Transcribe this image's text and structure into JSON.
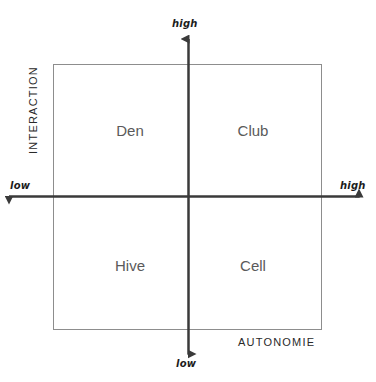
{
  "diagram": {
    "type": "2x2-matrix",
    "background_color": "#ffffff",
    "box_border_color": "#8d8d8d",
    "axis_color": "#3a3a3a",
    "quadrant_label_color": "#5a5a5a",
    "axes": {
      "vertical": {
        "title": "INTERACTION",
        "high_label": "high",
        "low_label": "low"
      },
      "horizontal": {
        "title": "AUTONOMIE",
        "high_label": "high",
        "low_label": "low"
      }
    },
    "quadrants": [
      {
        "key": "den",
        "label": "Den",
        "position": "top-left",
        "autonomie": "low",
        "interaction": "high"
      },
      {
        "key": "club",
        "label": "Club",
        "position": "top-right",
        "autonomie": "high",
        "interaction": "high"
      },
      {
        "key": "hive",
        "label": "Hive",
        "position": "bottom-left",
        "autonomie": "low",
        "interaction": "low"
      },
      {
        "key": "cell",
        "label": "Cell",
        "position": "bottom-right",
        "autonomie": "high",
        "interaction": "low"
      }
    ]
  }
}
